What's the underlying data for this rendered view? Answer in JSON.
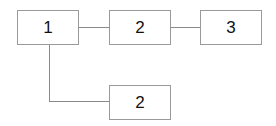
{
  "diagram": {
    "type": "flowchart",
    "nodes": [
      {
        "id": "n1",
        "label": "1"
      },
      {
        "id": "n2a",
        "label": "2"
      },
      {
        "id": "n3",
        "label": "3"
      },
      {
        "id": "n2b",
        "label": "2"
      }
    ],
    "edges": [
      {
        "from": "n1",
        "to": "n2a"
      },
      {
        "from": "n2a",
        "to": "n3"
      },
      {
        "from": "n1",
        "to": "n2b"
      }
    ],
    "colors": {
      "border": "#9a9a9a",
      "connector": "#8a8a8a",
      "text": "#111111",
      "background": "#ffffff"
    }
  }
}
